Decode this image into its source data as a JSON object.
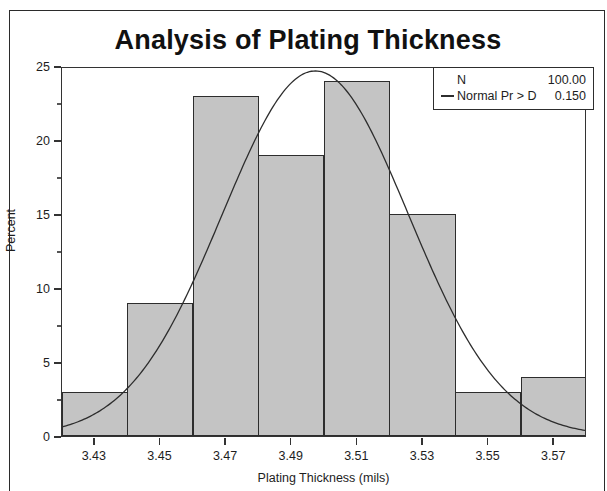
{
  "top_sliver_text": "",
  "chart": {
    "title": "Analysis of Plating Thickness",
    "x_axis_title": "Plating Thickness (mils)",
    "y_axis_title": "Percent"
  },
  "legend": {
    "rows": [
      {
        "swatch": "none",
        "label": "N",
        "value": "100.00"
      },
      {
        "swatch": "line",
        "label": "Normal Pr > D",
        "value": "0.150"
      }
    ]
  },
  "chart_data": {
    "type": "bar",
    "title": "Analysis of Plating Thickness",
    "xlabel": "Plating Thickness (mils)",
    "ylabel": "Percent",
    "categories": [
      "3.43",
      "3.45",
      "3.47",
      "3.49",
      "3.51",
      "3.53",
      "3.55",
      "3.57"
    ],
    "values": [
      3,
      9,
      23,
      19,
      24,
      15,
      3,
      4
    ],
    "bin_width": 0.02,
    "xlim": [
      3.42,
      3.58
    ],
    "ylim": [
      0,
      25
    ],
    "y_ticks": [
      0,
      5,
      10,
      15,
      20,
      25
    ],
    "y_minor_ticks": [
      2.5,
      7.5,
      12.5,
      17.5,
      22.5
    ],
    "x_ticks": [
      "3.43",
      "3.45",
      "3.47",
      "3.49",
      "3.51",
      "3.53",
      "3.55",
      "3.57"
    ],
    "grid": false,
    "legend_position": "top-right",
    "bar_fill_color": "#c4c4c4",
    "bar_edge_color": "#2d2d2d",
    "overlay": {
      "type": "line",
      "name": "Normal",
      "mean": 3.4975,
      "std_dev": 0.0285,
      "peak_percent": 24.8,
      "stats": {
        "N": "100.00",
        "Normal Pr > D": "0.150"
      }
    }
  }
}
